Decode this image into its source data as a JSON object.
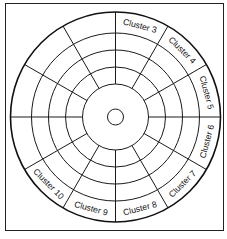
{
  "diagram": {
    "type": "disk-platter-sectors",
    "center": [
      115.5,
      117
    ],
    "radii": {
      "hub": 8,
      "inner": 33,
      "rings": [
        50,
        67,
        84
      ],
      "outer": 105
    },
    "sector_count": 12,
    "label_radius": 94.5,
    "stroke_color": "#1a1a1a",
    "background": "#ffffff",
    "labels": [
      {
        "text": "Cluster 3",
        "angle": 15
      },
      {
        "text": "Cluster 4",
        "angle": 45
      },
      {
        "text": "Cluster 5",
        "angle": 75
      },
      {
        "text": "Cluster 6",
        "angle": 105
      },
      {
        "text": "Cluster 7",
        "angle": 135
      },
      {
        "text": "Cluster 8",
        "angle": 165
      },
      {
        "text": "Cluster 9",
        "angle": 195
      },
      {
        "text": "Cluster 10",
        "angle": 225
      }
    ]
  }
}
